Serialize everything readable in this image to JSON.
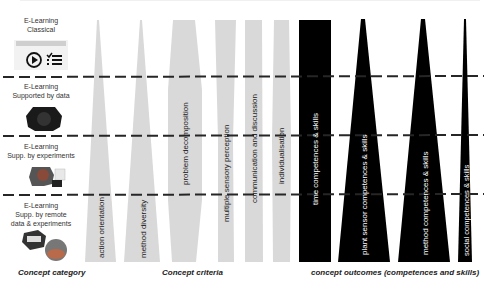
{
  "categories": [
    {
      "line1": "E-Learning",
      "line2": "Classical",
      "line3": ""
    },
    {
      "line1": "E-Learning",
      "line2": "Supported by data",
      "line3": ""
    },
    {
      "line1": "E-Learning",
      "line2": "Supp. by experiments",
      "line3": ""
    },
    {
      "line1": "E-Learning",
      "line2": "Supp. by remote",
      "line3": "data & experiments"
    }
  ],
  "thumb_classical": {
    "header": "Lecture Insights",
    "left": "Podcasts",
    "right": "Tracks"
  },
  "criteria": [
    {
      "label": "action orientation",
      "shape": "triangle-up",
      "color": "#d9d9d9"
    },
    {
      "label": "method diversity",
      "shape": "triangle-up",
      "color": "#d9d9d9"
    },
    {
      "label": "problem decomposition",
      "shape": "bulge",
      "color": "#d9d9d9"
    },
    {
      "label": "multiple sensory perception",
      "shape": "pinched",
      "color": "#d9d9d9"
    },
    {
      "label": "communication and discussion",
      "shape": "bar",
      "color": "#d9d9d9"
    },
    {
      "label": "individualisation",
      "shape": "bar",
      "color": "#d9d9d9"
    }
  ],
  "outcomes": [
    {
      "label": "time competences & skills",
      "shape": "bar",
      "color": "#000000"
    },
    {
      "label": "plant sensor competences & skills",
      "shape": "triangle-up",
      "color": "#000000"
    },
    {
      "label": "method competences & skills",
      "shape": "triangle-up",
      "color": "#000000"
    },
    {
      "label": "social competences & skills",
      "shape": "triangle-up",
      "color": "#000000"
    }
  ],
  "footer": {
    "category": "Concept category",
    "criteria": "Concept criteria",
    "outcomes": "concept outcomes (competences and skills)"
  },
  "colors": {
    "criteria_fill": "#d9d9d9",
    "outcome_fill": "#000000",
    "dash": "#262626",
    "outcome_text": "#ffffff"
  }
}
